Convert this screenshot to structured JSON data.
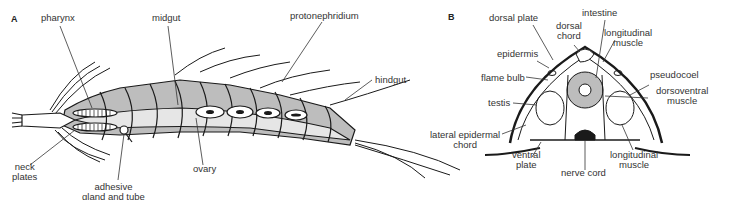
{
  "figure": {
    "panels": [
      {
        "id": "A",
        "label": "A",
        "labels": {
          "pharynx": "pharynx",
          "midgut": "midgut",
          "protonephridium": "protonephridium",
          "hindgut": "hindgut",
          "neck_plates_1": "neck",
          "neck_plates_2": "plates",
          "adhesive_1": "adhesive",
          "adhesive_2": "gland and tube",
          "ovary": "ovary"
        }
      },
      {
        "id": "B",
        "label": "B",
        "labels": {
          "dorsal_plate": "dorsal plate",
          "dorsal_chord_1": "dorsal",
          "dorsal_chord_2": "chord",
          "intestine": "intestine",
          "longitudinal_muscle_top_1": "longitudinal",
          "longitudinal_muscle_top_2": "muscle",
          "epidermis": "epidermis",
          "flame_bulb": "flame bulb",
          "pseudocoel": "pseudocoel",
          "dorsoventral_1": "dorsoventral",
          "dorsoventral_2": "muscle",
          "testis": "testis",
          "lateral_1": "lateral epidermal",
          "lateral_2": "chord",
          "ventral_plate_1": "ventral",
          "ventral_plate_2": "plate",
          "nerve_cord": "nerve cord",
          "longitudinal_muscle_bottom_1": "longitudinal",
          "longitudinal_muscle_bottom_2": "muscle"
        }
      }
    ],
    "colors": {
      "fill_gray": "#bdbdbd",
      "fill_light": "#e6e6e6",
      "stroke": "#1a1a1a"
    }
  }
}
